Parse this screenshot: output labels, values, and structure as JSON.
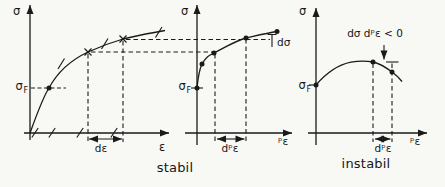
{
  "figure": {
    "colors": {
      "background": "#f8f8f5",
      "ink": "#1a1a1a"
    },
    "plots": {
      "left": {
        "y_axis_label": "σ",
        "x_axis_label": "ε",
        "yield_stress": {
          "main": "σ",
          "sub": "F"
        },
        "strain_increment_label": "dε"
      },
      "middle": {
        "y_axis_label": "σ",
        "x_axis_label": "ᵖε",
        "yield_stress": {
          "main": "σ",
          "sub": "F"
        },
        "plastic_strain_increment_label": "dᵖε",
        "stress_increment_label": "dσ",
        "caption": "stabil"
      },
      "right": {
        "y_axis_label": "σ",
        "x_axis_label": "ᵖε",
        "yield_stress": {
          "main": "σ",
          "sub": "F"
        },
        "plastic_strain_increment_label": "dᵖε",
        "stability_condition": "dσ dᵖε < 0",
        "caption": "instabil"
      }
    }
  }
}
